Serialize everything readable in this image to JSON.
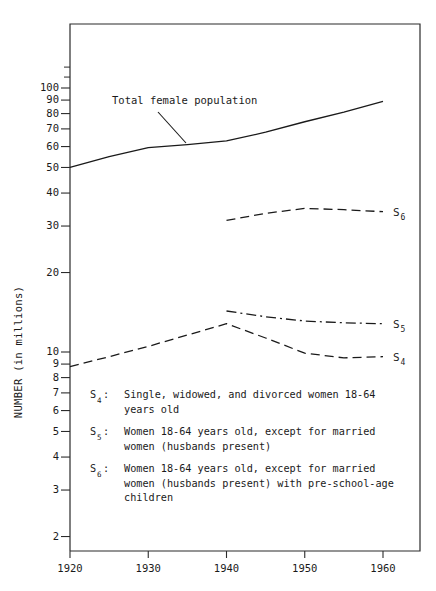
{
  "chart_data": {
    "type": "line",
    "title": "",
    "xlabel": "",
    "ylabel": "NUMBER (in millions)",
    "yscale": "log",
    "ylim": [
      2,
      130
    ],
    "xlim": [
      1918,
      1966
    ],
    "grid": false,
    "legend_position": "inside-lower-left",
    "x_ticks": [
      "1920",
      "1930",
      "1940",
      "1950",
      "1960"
    ],
    "x_tick_values": [
      1920,
      1930,
      1940,
      1950,
      1960
    ],
    "y_ticks": [
      "2",
      "3",
      "4",
      "5",
      "6",
      "7",
      "8",
      "9",
      "10",
      "20",
      "30",
      "40",
      "50",
      "60",
      "70",
      "80",
      "90",
      "100"
    ],
    "y_tick_values": [
      2,
      3,
      4,
      5,
      6,
      7,
      8,
      9,
      10,
      20,
      30,
      40,
      50,
      60,
      70,
      80,
      90,
      100
    ],
    "series": [
      {
        "name": "Total female population",
        "label": "Total female population",
        "style": "solid",
        "x": [
          1920,
          1925,
          1930,
          1935,
          1940,
          1945,
          1950,
          1955,
          1960
        ],
        "values": [
          50.0,
          55.0,
          59.5,
          61.0,
          63.0,
          68.0,
          74.5,
          81.0,
          89.0
        ]
      },
      {
        "name": "S6",
        "label": "S",
        "sublabel": "6",
        "style": "dashed",
        "x": [
          1940,
          1945,
          1950,
          1955,
          1960
        ],
        "values": [
          31.5,
          33.5,
          35.0,
          34.6,
          34.0
        ]
      },
      {
        "name": "S5",
        "label": "S",
        "sublabel": "5",
        "style": "dash-dot",
        "x": [
          1940,
          1945,
          1950,
          1955,
          1960
        ],
        "values": [
          14.3,
          13.6,
          13.1,
          12.9,
          12.8
        ]
      },
      {
        "name": "S4",
        "label": "S",
        "sublabel": "4",
        "style": "dashed",
        "x": [
          1920,
          1925,
          1930,
          1935,
          1940,
          1945,
          1950,
          1955,
          1960
        ],
        "values": [
          8.8,
          9.6,
          10.5,
          11.6,
          12.8,
          11.3,
          9.9,
          9.5,
          9.6
        ]
      }
    ],
    "annotations": [
      {
        "name": "total-female-population-callout",
        "text": "Total female population",
        "text_x": 112,
        "text_y": 104,
        "leader_from": [
          158,
          112
        ],
        "leader_to": [
          186,
          143
        ]
      }
    ]
  },
  "legend": {
    "entries": [
      {
        "key": "S",
        "key_sub": "4",
        "colon": ":",
        "lines": [
          "Single, widowed, and divorced women 18-64",
          "years old"
        ]
      },
      {
        "key": "S",
        "key_sub": "5",
        "colon": ":",
        "lines": [
          "Women 18-64 years old, except for married",
          "women (husbands present)"
        ]
      },
      {
        "key": "S",
        "key_sub": "6",
        "colon": ":",
        "lines": [
          "Women 18-64 years old, except for married",
          "women (husbands present) with pre-school-age",
          "children"
        ]
      }
    ]
  },
  "colors": {
    "ink": "#1a1a1a",
    "axis": "#2b2b2b",
    "background": "#ffffff"
  }
}
